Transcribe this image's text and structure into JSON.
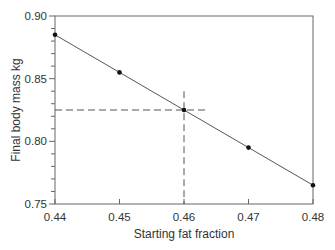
{
  "chart_data": {
    "type": "line",
    "title": "",
    "xlabel": "Starting fat fraction",
    "ylabel": "Final body mass kg",
    "xlim": [
      0.44,
      0.48
    ],
    "ylim": [
      0.75,
      0.9
    ],
    "x_ticks": [
      "0.44",
      "0.45",
      "0.46",
      "0.47",
      "0.48"
    ],
    "y_ticks": [
      "0.90",
      "0.85",
      "0.80",
      "0.75"
    ],
    "y_minor_tick_step": 0.01,
    "grid": false,
    "legend": null,
    "series": [
      {
        "name": "Final body mass",
        "x": [
          0.44,
          0.45,
          0.46,
          0.47,
          0.48
        ],
        "values": [
          0.885,
          0.855,
          0.825,
          0.795,
          0.765
        ],
        "marker": "circle",
        "color": "#555555"
      }
    ],
    "annotations": [
      {
        "type": "dashed-hline",
        "y": 0.825,
        "x_from": 0.44,
        "x_to": 0.4634,
        "color": "#555555"
      },
      {
        "type": "dashed-vline",
        "x": 0.46,
        "y_from": 0.75,
        "y_to": 0.84,
        "color": "#555555"
      }
    ]
  },
  "axes": {
    "x_title": "Starting fat fraction",
    "y_title": "Final body mass kg",
    "x_tick_labels": [
      "0.44",
      "0.45",
      "0.46",
      "0.47",
      "0.48"
    ],
    "y_tick_labels": [
      "0.90",
      "0.85",
      "0.80",
      "0.75"
    ]
  },
  "colors": {
    "axis": "#666666",
    "line": "#555555",
    "marker": "#111111",
    "text": "#333333"
  }
}
